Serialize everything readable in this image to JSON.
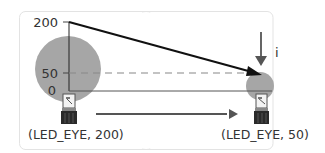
{
  "diagram": {
    "y_axis": {
      "ticks": [
        "200",
        "50",
        "0"
      ]
    },
    "current_label": "i",
    "states": [
      {
        "label": "(LED_EYE, 200)",
        "brightness": 200
      },
      {
        "label": "(LED_EYE, 50)",
        "brightness": 50
      }
    ],
    "colors": {
      "circle": "#a6a6a6",
      "line": "#111111",
      "arrow": "#4d4d4d",
      "dashed": "#888888",
      "frame": "#e3e3e3"
    }
  }
}
